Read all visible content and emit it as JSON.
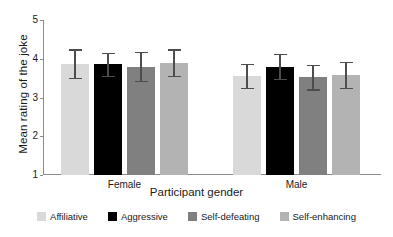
{
  "chart_data": {
    "type": "bar",
    "title": "",
    "xlabel": "Participant gender",
    "ylabel": "Mean rating of the joke",
    "categories": [
      "Female",
      "Male"
    ],
    "ylim": [
      1,
      5
    ],
    "yticks": [
      "1",
      "2",
      "3",
      "4",
      "5"
    ],
    "grid": false,
    "legend_position": "bottom",
    "error_bars": "yes",
    "series": [
      {
        "name": "Affiliative",
        "color": "#d9d9d9",
        "values": [
          3.87,
          3.55
        ],
        "errors": [
          0.37,
          0.31
        ]
      },
      {
        "name": "Aggressive",
        "color": "#000000",
        "values": [
          3.86,
          3.8
        ],
        "errors": [
          0.3,
          0.33
        ]
      },
      {
        "name": "Self-defeating",
        "color": "#808080",
        "values": [
          3.8,
          3.53
        ],
        "errors": [
          0.37,
          0.32
        ]
      },
      {
        "name": "Self-enhancing",
        "color": "#b3b3b3",
        "values": [
          3.9,
          3.58
        ],
        "errors": [
          0.34,
          0.34
        ]
      }
    ]
  },
  "axes": {
    "y_title": "Mean rating of the joke",
    "x_title": "Participant gender",
    "y_ticks": [
      "5",
      "4",
      "3",
      "2",
      "1"
    ],
    "group_labels": [
      "Female",
      "Male"
    ]
  },
  "legend": {
    "items": [
      {
        "label": "Affiliative",
        "color": "#d9d9d9"
      },
      {
        "label": "Aggressive",
        "color": "#000000"
      },
      {
        "label": "Self-defeating",
        "color": "#808080"
      },
      {
        "label": "Self-enhancing",
        "color": "#b3b3b3"
      }
    ]
  }
}
